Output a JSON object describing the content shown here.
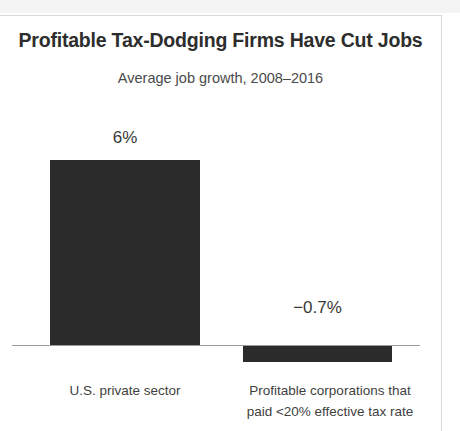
{
  "chart_data": {
    "type": "bar",
    "title": "Profitable Tax-Dodging Firms Have Cut Jobs",
    "subtitle": "Average job growth, 2008–2016",
    "categories": [
      "U.S. private sector",
      "Profitable corporations that paid <20% effective tax rate"
    ],
    "values": [
      6,
      -0.7
    ],
    "value_labels": [
      "6%",
      "−0.7%"
    ],
    "xlabel": "",
    "ylabel": "",
    "ylim": [
      -1,
      6.5
    ],
    "grid": false,
    "legend": "none",
    "bar_color": "#2b2b2b",
    "baseline_value": 0
  },
  "labels": {
    "category_left": "U.S. private sector",
    "category_right_line1": "Profitable corporations that",
    "category_right_line2": "paid <20% effective tax rate",
    "value_left": "6%",
    "value_right": "−0.7%"
  },
  "colors": {
    "bar": "#2b2b2b",
    "axis": "#9a9a9a",
    "title": "#2d2d2d",
    "subtitle": "#4a4a4a",
    "label": "#3f3f3f",
    "frame": "#d8d8d8",
    "background": "#ffffff"
  }
}
